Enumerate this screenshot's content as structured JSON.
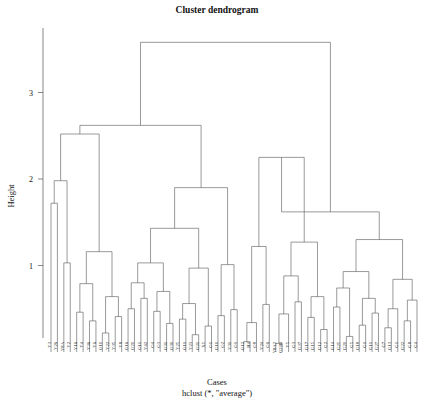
{
  "chart_data": {
    "type": "dendrogram",
    "title": "Cluster dendrogram",
    "xlabel": "Cases",
    "sublabel": "hclust (*, \"average\")",
    "ylabel": "Height",
    "ylim": [
      0,
      3.75
    ],
    "yticks": [
      1,
      2,
      3
    ],
    "ytick_labels": [
      "1",
      "2",
      "3"
    ],
    "grid": false,
    "method": "average",
    "n_leaves": 58,
    "leaf_order": [
      "Y3",
      "Y26",
      "Y8A",
      "Y2",
      "Y16",
      "Y4",
      "Y36",
      "Y6",
      "O10",
      "Y22",
      "Y35",
      "Y8",
      "O16",
      "O20",
      "O11",
      "Y42",
      "O4",
      "O3",
      "O31",
      "O30",
      "Y25",
      "O19",
      "Y23",
      "O21",
      "X5",
      "O1",
      "G10",
      "O2",
      "Y39",
      "O9",
      "O12",
      "H4",
      "O8",
      "Y24",
      "O6",
      "Y8A2",
      "O21B",
      "Y5",
      "G3",
      "G37",
      "G17",
      "G15",
      "G12",
      "G2",
      "G14",
      "G25",
      "G20",
      "G5",
      "G18",
      "G9",
      "G11",
      "G27",
      "G7",
      "G13",
      "G1",
      "G22",
      "G8",
      "G4"
    ],
    "merges": [
      {
        "id": 1,
        "a": {
          "t": "leaf",
          "i": 1
        },
        "b": {
          "t": "leaf",
          "i": 2
        },
        "h": 1.72
      },
      {
        "id": 2,
        "a": {
          "t": "leaf",
          "i": 3
        },
        "b": {
          "t": "leaf",
          "i": 4
        },
        "h": 1.03
      },
      {
        "id": 3,
        "a": {
          "t": "node",
          "i": 1
        },
        "b": {
          "t": "node",
          "i": 2
        },
        "h": 1.98
      },
      {
        "id": 4,
        "a": {
          "t": "leaf",
          "i": 5
        },
        "b": {
          "t": "leaf",
          "i": 6
        },
        "h": 0.46
      },
      {
        "id": 5,
        "a": {
          "t": "leaf",
          "i": 7
        },
        "b": {
          "t": "leaf",
          "i": 8
        },
        "h": 0.36
      },
      {
        "id": 6,
        "a": {
          "t": "node",
          "i": 4
        },
        "b": {
          "t": "node",
          "i": 5
        },
        "h": 0.79
      },
      {
        "id": 7,
        "a": {
          "t": "leaf",
          "i": 9
        },
        "b": {
          "t": "leaf",
          "i": 10
        },
        "h": 0.22
      },
      {
        "id": 8,
        "a": {
          "t": "leaf",
          "i": 11
        },
        "b": {
          "t": "leaf",
          "i": 12
        },
        "h": 0.41
      },
      {
        "id": 9,
        "a": {
          "t": "node",
          "i": 7
        },
        "b": {
          "t": "node",
          "i": 8
        },
        "h": 0.64
      },
      {
        "id": 10,
        "a": {
          "t": "node",
          "i": 6
        },
        "b": {
          "t": "node",
          "i": 9
        },
        "h": 1.16
      },
      {
        "id": 11,
        "a": {
          "t": "node",
          "i": 3
        },
        "b": {
          "t": "node",
          "i": 10
        },
        "h": 2.52
      },
      {
        "id": 12,
        "a": {
          "t": "leaf",
          "i": 13
        },
        "b": {
          "t": "leaf",
          "i": 14
        },
        "h": 0.5
      },
      {
        "id": 13,
        "a": {
          "t": "leaf",
          "i": 15
        },
        "b": {
          "t": "leaf",
          "i": 16
        },
        "h": 0.62
      },
      {
        "id": 14,
        "a": {
          "t": "node",
          "i": 12
        },
        "b": {
          "t": "node",
          "i": 13
        },
        "h": 0.8
      },
      {
        "id": 15,
        "a": {
          "t": "leaf",
          "i": 17
        },
        "b": {
          "t": "leaf",
          "i": 18
        },
        "h": 0.47
      },
      {
        "id": 16,
        "a": {
          "t": "leaf",
          "i": 19
        },
        "b": {
          "t": "leaf",
          "i": 20
        },
        "h": 0.33
      },
      {
        "id": 17,
        "a": {
          "t": "node",
          "i": 15
        },
        "b": {
          "t": "node",
          "i": 16
        },
        "h": 0.7
      },
      {
        "id": 18,
        "a": {
          "t": "node",
          "i": 14
        },
        "b": {
          "t": "node",
          "i": 17
        },
        "h": 1.03
      },
      {
        "id": 19,
        "a": {
          "t": "leaf",
          "i": 21
        },
        "b": {
          "t": "leaf",
          "i": 22
        },
        "h": 0.38
      },
      {
        "id": 20,
        "a": {
          "t": "leaf",
          "i": 23
        },
        "b": {
          "t": "leaf",
          "i": 24
        },
        "h": 0.2
      },
      {
        "id": 21,
        "a": {
          "t": "node",
          "i": 19
        },
        "b": {
          "t": "node",
          "i": 20
        },
        "h": 0.56
      },
      {
        "id": 22,
        "a": {
          "t": "leaf",
          "i": 25
        },
        "b": {
          "t": "leaf",
          "i": 26
        },
        "h": 0.3
      },
      {
        "id": 23,
        "a": {
          "t": "node",
          "i": 21
        },
        "b": {
          "t": "node",
          "i": 22
        },
        "h": 0.97
      },
      {
        "id": 24,
        "a": {
          "t": "node",
          "i": 18
        },
        "b": {
          "t": "node",
          "i": 23
        },
        "h": 1.43
      },
      {
        "id": 25,
        "a": {
          "t": "leaf",
          "i": 27
        },
        "b": {
          "t": "leaf",
          "i": 28
        },
        "h": 0.42
      },
      {
        "id": 26,
        "a": {
          "t": "leaf",
          "i": 29
        },
        "b": {
          "t": "leaf",
          "i": 30
        },
        "h": 0.49
      },
      {
        "id": 27,
        "a": {
          "t": "node",
          "i": 25
        },
        "b": {
          "t": "node",
          "i": 26
        },
        "h": 1.01
      },
      {
        "id": 28,
        "a": {
          "t": "node",
          "i": 24
        },
        "b": {
          "t": "node",
          "i": 27
        },
        "h": 1.9
      },
      {
        "id": 29,
        "a": {
          "t": "node",
          "i": 11
        },
        "b": {
          "t": "node",
          "i": 28
        },
        "h": 2.62
      },
      {
        "id": 30,
        "a": {
          "t": "leaf",
          "i": 31
        },
        "b": {
          "t": "leaf",
          "i": 32
        },
        "h": 0.12
      },
      {
        "id": 31,
        "a": {
          "t": "leaf",
          "i": 33
        },
        "b": {
          "t": "node",
          "i": 30
        },
        "h": 0.34
      },
      {
        "id": 32,
        "a": {
          "t": "leaf",
          "i": 34
        },
        "b": {
          "t": "leaf",
          "i": 35
        },
        "h": 0.55
      },
      {
        "id": 33,
        "a": {
          "t": "node",
          "i": 31
        },
        "b": {
          "t": "node",
          "i": 32
        },
        "h": 1.22
      },
      {
        "id": 34,
        "a": {
          "t": "leaf",
          "i": 36
        },
        "b": {
          "t": "leaf",
          "i": 37
        },
        "h": 0.1
      },
      {
        "id": 35,
        "a": {
          "t": "leaf",
          "i": 38
        },
        "b": {
          "t": "node",
          "i": 34
        },
        "h": 0.44
      },
      {
        "id": 36,
        "a": {
          "t": "leaf",
          "i": 39
        },
        "b": {
          "t": "leaf",
          "i": 40
        },
        "h": 0.58
      },
      {
        "id": 37,
        "a": {
          "t": "node",
          "i": 35
        },
        "b": {
          "t": "node",
          "i": 36
        },
        "h": 0.88
      },
      {
        "id": 38,
        "a": {
          "t": "leaf",
          "i": 41
        },
        "b": {
          "t": "leaf",
          "i": 42
        },
        "h": 0.4
      },
      {
        "id": 39,
        "a": {
          "t": "leaf",
          "i": 43
        },
        "b": {
          "t": "leaf",
          "i": 44
        },
        "h": 0.26
      },
      {
        "id": 40,
        "a": {
          "t": "node",
          "i": 38
        },
        "b": {
          "t": "node",
          "i": 39
        },
        "h": 0.64
      },
      {
        "id": 41,
        "a": {
          "t": "node",
          "i": 37
        },
        "b": {
          "t": "node",
          "i": 40
        },
        "h": 1.27
      },
      {
        "id": 42,
        "a": {
          "t": "node",
          "i": 33
        },
        "b": {
          "t": "node",
          "i": 41
        },
        "h": 2.25
      },
      {
        "id": 43,
        "a": {
          "t": "leaf",
          "i": 45
        },
        "b": {
          "t": "leaf",
          "i": 46
        },
        "h": 0.52
      },
      {
        "id": 44,
        "a": {
          "t": "leaf",
          "i": 47
        },
        "b": {
          "t": "leaf",
          "i": 48
        },
        "h": 0.18
      },
      {
        "id": 45,
        "a": {
          "t": "node",
          "i": 43
        },
        "b": {
          "t": "node",
          "i": 44
        },
        "h": 0.74
      },
      {
        "id": 46,
        "a": {
          "t": "leaf",
          "i": 49
        },
        "b": {
          "t": "leaf",
          "i": 50
        },
        "h": 0.31
      },
      {
        "id": 47,
        "a": {
          "t": "leaf",
          "i": 51
        },
        "b": {
          "t": "leaf",
          "i": 52
        },
        "h": 0.45
      },
      {
        "id": 48,
        "a": {
          "t": "node",
          "i": 46
        },
        "b": {
          "t": "node",
          "i": 47
        },
        "h": 0.62
      },
      {
        "id": 49,
        "a": {
          "t": "node",
          "i": 45
        },
        "b": {
          "t": "node",
          "i": 48
        },
        "h": 0.93
      },
      {
        "id": 50,
        "a": {
          "t": "leaf",
          "i": 53
        },
        "b": {
          "t": "leaf",
          "i": 54
        },
        "h": 0.28
      },
      {
        "id": 51,
        "a": {
          "t": "leaf",
          "i": 55
        },
        "b": {
          "t": "node",
          "i": 50
        },
        "h": 0.5
      },
      {
        "id": 52,
        "a": {
          "t": "leaf",
          "i": 56
        },
        "b": {
          "t": "leaf",
          "i": 57
        },
        "h": 0.36
      },
      {
        "id": 53,
        "a": {
          "t": "leaf",
          "i": 58
        },
        "b": {
          "t": "node",
          "i": 52
        },
        "h": 0.6
      },
      {
        "id": 54,
        "a": {
          "t": "node",
          "i": 51
        },
        "b": {
          "t": "node",
          "i": 53
        },
        "h": 0.84
      },
      {
        "id": 55,
        "a": {
          "t": "node",
          "i": 49
        },
        "b": {
          "t": "node",
          "i": 54
        },
        "h": 1.3
      },
      {
        "id": 56,
        "a": {
          "t": "node",
          "i": 42
        },
        "b": {
          "t": "node",
          "i": 55
        },
        "h": 1.62
      },
      {
        "id": 57,
        "a": {
          "t": "node",
          "i": 29
        },
        "b": {
          "t": "node",
          "i": 56
        },
        "h": 3.58
      }
    ]
  },
  "layout": {
    "plot_left": 51,
    "plot_right": 417,
    "axis_x": 43,
    "baseline_y": 338,
    "y_zero": 352,
    "y_per_unit": 86.5
  }
}
